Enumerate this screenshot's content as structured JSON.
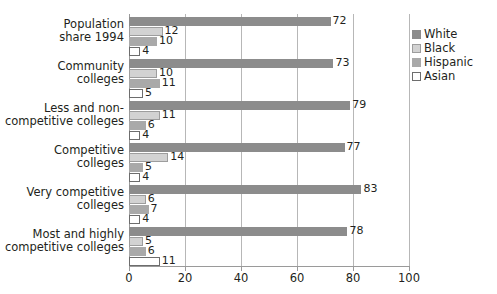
{
  "chart_data": {
    "type": "bar",
    "orientation": "horizontal",
    "title": "",
    "subtitle": "",
    "xlabel": "",
    "ylabel": "",
    "xlim": [
      0,
      100
    ],
    "xticks": [
      0,
      20,
      40,
      60,
      80,
      100
    ],
    "xtick_labels": [
      "0",
      "20",
      "40",
      "60",
      "80",
      "100"
    ],
    "grid": "vertical",
    "legend_position": "right",
    "categories": [
      "Population share 1994",
      "Community colleges",
      "Less and non-competitive colleges",
      "Competitive colleges",
      "Very competitive colleges",
      "Most and highly competitive colleges"
    ],
    "category_lines": [
      [
        "Population",
        "share 1994"
      ],
      [
        "Community",
        "colleges"
      ],
      [
        "Less and non-",
        "competitive colleges"
      ],
      [
        "Competitive",
        "colleges"
      ],
      [
        "Very competitive",
        "colleges"
      ],
      [
        "Most and highly",
        "competitive colleges"
      ]
    ],
    "series": [
      {
        "name": "White",
        "color": "#8c8c8c",
        "values": [
          72,
          73,
          79,
          77,
          83,
          78
        ]
      },
      {
        "name": "Black",
        "color": "#d2d2d2",
        "values": [
          12,
          10,
          11,
          14,
          6,
          5
        ]
      },
      {
        "name": "Hispanic",
        "color": "#a9a9a9",
        "values": [
          10,
          11,
          6,
          5,
          7,
          6
        ]
      },
      {
        "name": "Asian",
        "color": "#ffffff",
        "values": [
          4,
          5,
          4,
          4,
          4,
          11
        ]
      }
    ]
  },
  "legend": {
    "items": [
      {
        "label": "White",
        "key": "white"
      },
      {
        "label": "Black",
        "key": "black"
      },
      {
        "label": "Hispanic",
        "key": "hispanic"
      },
      {
        "label": "Asian",
        "key": "asian"
      }
    ]
  }
}
